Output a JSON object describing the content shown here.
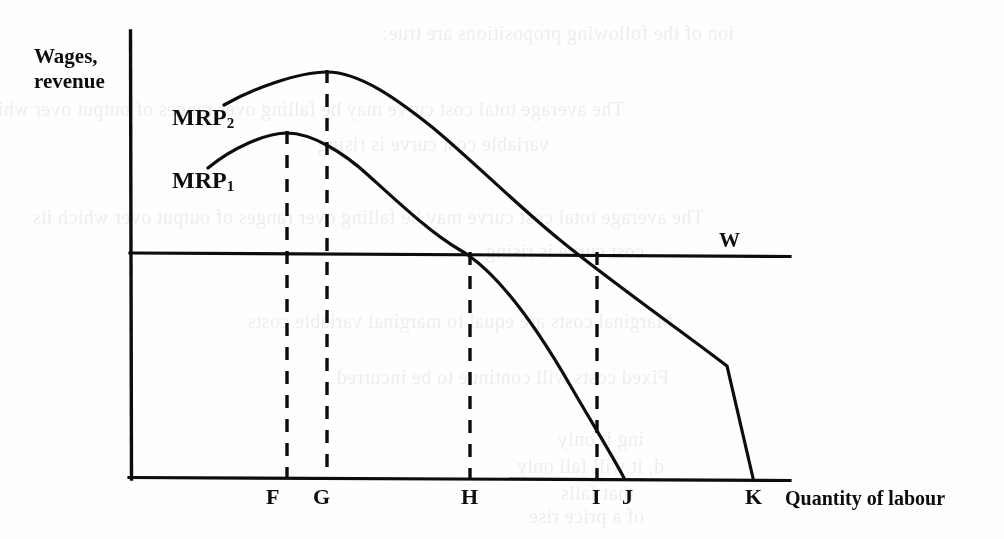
{
  "figure": {
    "caption_axes": {
      "y_axis_label_line1": "Wages,",
      "y_axis_label_line2": "revenue",
      "x_axis_label": "Quantity of labour"
    },
    "curve_labels": {
      "mrp2_base": "MRP",
      "mrp2_sub": "2",
      "mrp1_base": "MRP",
      "mrp1_sub": "1"
    },
    "wage_line_label": "W",
    "tick_labels": [
      "F",
      "G",
      "H",
      "I",
      "J",
      "K"
    ],
    "colors": {
      "ink": "#0d0d0d",
      "paper": "#fefefe"
    }
  },
  "chart_data": {
    "type": "line",
    "title": "",
    "xlabel": "Quantity of labour",
    "ylabel": "Wages, revenue",
    "grid": false,
    "legend": "inline-curve-labels",
    "axis_origin_px": {
      "x": 130,
      "y": 478
    },
    "axis_extent_px": {
      "x_end": 790,
      "y_top": 31
    },
    "xlim": [
      0,
      1
    ],
    "ylim": [
      0,
      1
    ],
    "annotations": [
      {
        "label": "W",
        "type": "horizontal-line",
        "y_px": 254,
        "x_start_px": 130,
        "x_end_px": 790,
        "meaning": "wage rate line"
      },
      {
        "label": "F",
        "type": "vertical-dashed",
        "x_px": 287,
        "from_y_px": 133,
        "to_y_px": 478,
        "meaning": "quantity at MRP1 maximum"
      },
      {
        "label": "G",
        "type": "vertical-dashed",
        "x_px": 327,
        "from_y_px": 72,
        "to_y_px": 478,
        "meaning": "quantity at MRP2 maximum"
      },
      {
        "label": "H",
        "type": "vertical-dashed",
        "x_px": 470,
        "from_y_px": 254,
        "to_y_px": 478,
        "meaning": "quantity where MRP1 equals W"
      },
      {
        "label": "I",
        "type": "vertical-dashed",
        "x_px": 597,
        "from_y_px": 254,
        "to_y_px": 478,
        "meaning": "quantity where MRP2 equals W"
      },
      {
        "label": "J",
        "type": "axis-tick",
        "x_px": 625,
        "meaning": "quantity where MRP1 reaches zero"
      },
      {
        "label": "K",
        "type": "axis-tick",
        "x_px": 753,
        "meaning": "quantity where MRP2 reaches zero"
      }
    ],
    "series": [
      {
        "name": "MRP2",
        "label_px": {
          "x": 178,
          "y": 123
        },
        "peak_px": {
          "x": 327,
          "y": 72
        },
        "points_px": [
          [
            224,
            105
          ],
          [
            245,
            93
          ],
          [
            268,
            84
          ],
          [
            292,
            77
          ],
          [
            310,
            73
          ],
          [
            327,
            72
          ],
          [
            350,
            75
          ],
          [
            375,
            85
          ],
          [
            400,
            101
          ],
          [
            430,
            124
          ],
          [
            460,
            151
          ],
          [
            490,
            180
          ],
          [
            520,
            208
          ],
          [
            550,
            232
          ],
          [
            580,
            250
          ],
          [
            597,
            254
          ],
          [
            625,
            272
          ],
          [
            660,
            300
          ],
          [
            700,
            336
          ],
          [
            730,
            364
          ],
          [
            753,
            478
          ]
        ]
      },
      {
        "name": "MRP1",
        "label_px": {
          "x": 178,
          "y": 186
        },
        "peak_px": {
          "x": 287,
          "y": 133
        },
        "points_px": [
          [
            208,
            168
          ],
          [
            226,
            152
          ],
          [
            248,
            141
          ],
          [
            268,
            135
          ],
          [
            287,
            133
          ],
          [
            305,
            135
          ],
          [
            325,
            143
          ],
          [
            348,
            157
          ],
          [
            372,
            178
          ],
          [
            398,
            204
          ],
          [
            425,
            229
          ],
          [
            450,
            246
          ],
          [
            470,
            254
          ],
          [
            500,
            282
          ],
          [
            530,
            320
          ],
          [
            560,
            362
          ],
          [
            590,
            410
          ],
          [
            612,
            448
          ],
          [
            625,
            478
          ]
        ]
      }
    ]
  },
  "bleed_text": [
    {
      "text": "ion of the following propositions are true:",
      "x": 270,
      "y": 22
    },
    {
      "text": "The average total cost curve may be falling over ranges of output over which its",
      "x": 380,
      "y": 98
    },
    {
      "text": "variable cost curve is rising",
      "x": 455,
      "y": 133
    },
    {
      "text": "The average total cost curve may be falling over ranges of output over which its",
      "x": 300,
      "y": 206
    },
    {
      "text": "cost curve is rising",
      "x": 360,
      "y": 240
    },
    {
      "text": "Marginal costs are equal to marginal variable costs",
      "x": 330,
      "y": 310
    },
    {
      "text": "Fixed costs will continue to be incurred",
      "x": 335,
      "y": 366
    },
    {
      "text": "ing it only",
      "x": 360,
      "y": 428
    },
    {
      "text": "d, it will fall only",
      "x": 340,
      "y": 455
    },
    {
      "text": "that falls",
      "x": 370,
      "y": 482
    },
    {
      "text": "of a price rise",
      "x": 360,
      "y": 505
    }
  ]
}
